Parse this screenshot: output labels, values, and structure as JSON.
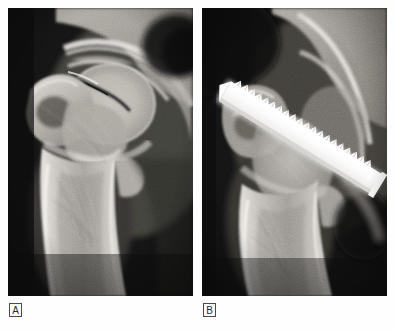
{
  "figure": {
    "type": "radiograph-pair",
    "modality": "X-ray",
    "view": "anteroposterior hip",
    "background_color": "#fdfdfd",
    "panel_background_color": "#0d0d0d"
  },
  "panels": [
    {
      "id": "A",
      "label": "A",
      "caption_label": "A",
      "description": "Preoperative anteroposterior radiograph of the proximal femur and hip showing femoral neck fracture",
      "position": {
        "left": 8,
        "top": 8,
        "width": 185,
        "height": 288
      },
      "anatomy": [
        "femoral head",
        "femoral neck",
        "fracture line",
        "greater trochanter",
        "lesser trochanter",
        "femoral shaft",
        "acetabulum",
        "ilium",
        "ischium",
        "obturator foramen"
      ],
      "hardware": []
    },
    {
      "id": "B",
      "label": "B",
      "caption_label": "B",
      "description": "Postoperative anteroposterior radiograph showing fixation with a threaded compression screw across the femoral neck",
      "position": {
        "left": 202,
        "top": 8,
        "width": 185,
        "height": 288
      },
      "anatomy": [
        "femoral head",
        "femoral neck",
        "greater trochanter",
        "femoral shaft",
        "acetabulum",
        "ilium",
        "ischium",
        "obturator foramen"
      ],
      "hardware": [
        {
          "name": "threaded compression screw",
          "appearance": "bright radiopaque serrated implant",
          "orientation": "oblique, upper-right to lower-left",
          "color": "#fbfbfb"
        }
      ]
    }
  ],
  "labels": {
    "panel_a": "A",
    "panel_b": "B"
  },
  "colors": {
    "film_background": "#0d0d0d",
    "bone_bright": "#e8e6e2",
    "bone_mid": "#a8a49e",
    "soft_tissue": "#5a5853",
    "implant": "#fbfbfb",
    "page_background": "#fdfdfd",
    "label_border": "#4a4a4a",
    "label_text": "#2b2b2b"
  }
}
